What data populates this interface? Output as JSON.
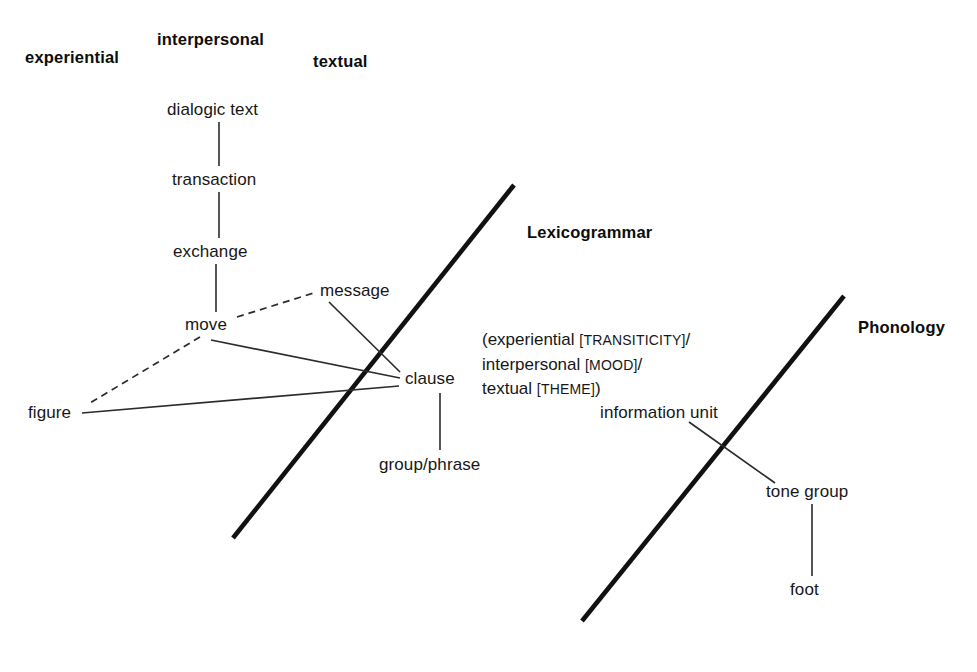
{
  "figure": {
    "metafunctions": [
      {
        "name": "experiential",
        "label": "experiential"
      },
      {
        "name": "interpersonal",
        "label": "interpersonal"
      },
      {
        "name": "textual",
        "label": "textual"
      }
    ],
    "strata": [
      {
        "name": "lexicogrammar",
        "label": "Lexicogrammar"
      },
      {
        "name": "phonology",
        "label": "Phonology"
      }
    ],
    "nodes": [
      {
        "name": "dialogic-text",
        "label": "dialogic text"
      },
      {
        "name": "transaction",
        "label": "transaction"
      },
      {
        "name": "exchange",
        "label": "exchange"
      },
      {
        "name": "move",
        "label": "move"
      },
      {
        "name": "message",
        "label": "message"
      },
      {
        "name": "figure",
        "label": "figure"
      },
      {
        "name": "clause",
        "label": "clause"
      },
      {
        "name": "group-phrase",
        "label": "group/phrase"
      },
      {
        "name": "information-unit",
        "label": "information unit"
      },
      {
        "name": "tone-group",
        "label": "tone group"
      },
      {
        "name": "foot",
        "label": "foot"
      }
    ],
    "metafunction_note": {
      "line1_text": "(experiential ",
      "line1_system": "[TRANSITICITY]",
      "line1_tail": "/",
      "line2_text": "interpersonal ",
      "line2_system": "[MOOD]",
      "line2_tail": "/",
      "line3_text": "textual ",
      "line3_system": "[THEME]",
      "line3_tail": ")"
    },
    "colors": {
      "ink": "#171717",
      "stratum_boundary": "#111111",
      "background": "#ffffff"
    }
  }
}
